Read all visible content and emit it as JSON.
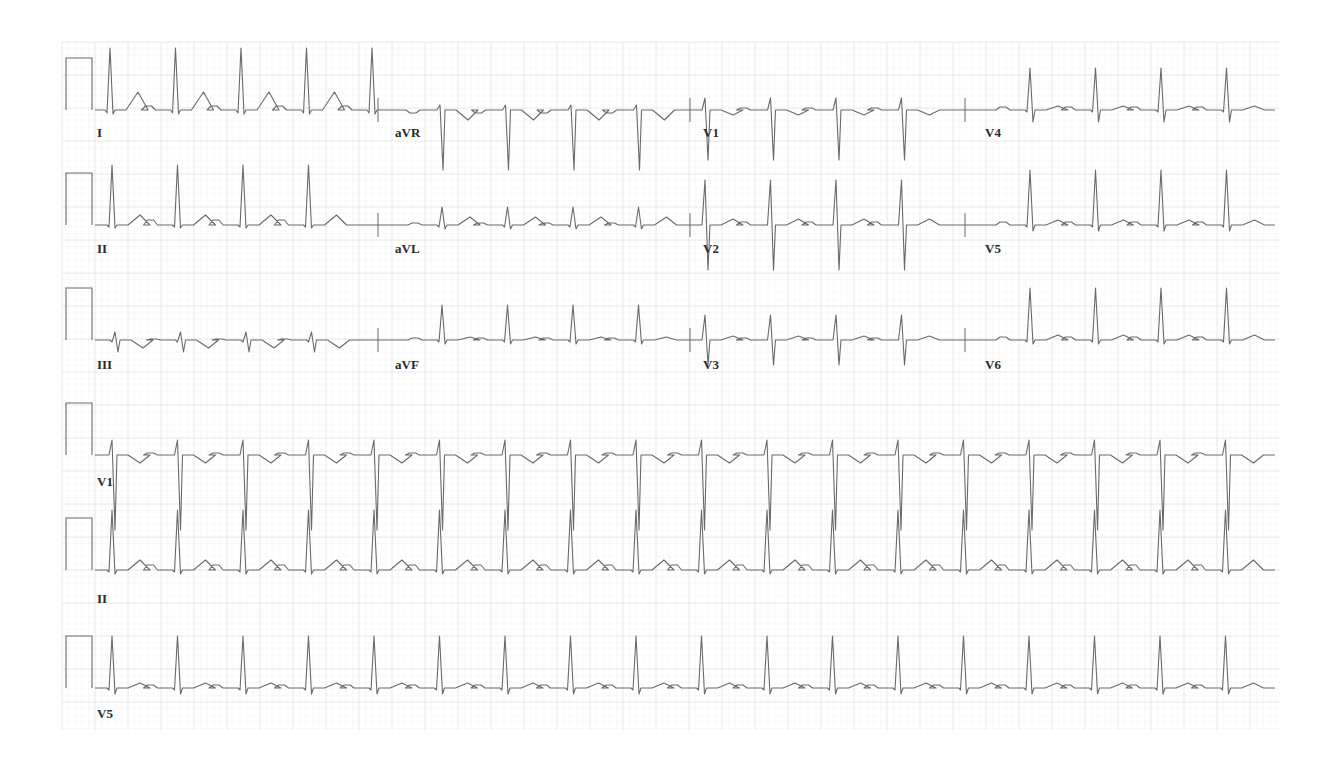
{
  "ecg": {
    "grid": {
      "left": 62,
      "top": 42,
      "right": 1280,
      "bottom": 730,
      "major_px": 33,
      "minor_color": "#f2f2f2",
      "major_color": "#e2e2e2"
    },
    "trace_color": "#6a6a6a",
    "rr_px": 65.5,
    "rows": [
      {
        "baseline": 110,
        "segments": [
          {
            "lead": "I",
            "x0": 95,
            "x1": 378,
            "first_beat": 110,
            "r": 62,
            "s": 4,
            "q": 3,
            "t": 18,
            "p": 4
          },
          {
            "lead": "aVR",
            "x0": 378,
            "x1": 690,
            "first_beat": 440,
            "r": 5,
            "s": 60,
            "q": 0,
            "t": -10,
            "p": -3
          },
          {
            "lead": "V1",
            "x0": 690,
            "x1": 965,
            "first_beat": 705,
            "r": 12,
            "s": 50,
            "q": 0,
            "t": -5,
            "p": 2
          },
          {
            "lead": "V4",
            "x0": 965,
            "x1": 1275,
            "first_beat": 1030,
            "r": 42,
            "s": 12,
            "q": 2,
            "t": 4,
            "p": 3
          }
        ]
      },
      {
        "baseline": 225,
        "segments": [
          {
            "lead": "II",
            "x0": 95,
            "x1": 378,
            "first_beat": 112,
            "r": 60,
            "s": 3,
            "q": 2,
            "t": 10,
            "p": 5
          },
          {
            "lead": "aVL",
            "x0": 378,
            "x1": 690,
            "first_beat": 442,
            "r": 18,
            "s": 4,
            "q": 2,
            "t": 8,
            "p": 2
          },
          {
            "lead": "V2",
            "x0": 690,
            "x1": 965,
            "first_beat": 705,
            "r": 45,
            "s": 45,
            "q": 0,
            "t": 6,
            "p": 3
          },
          {
            "lead": "V5",
            "x0": 965,
            "x1": 1275,
            "first_beat": 1030,
            "r": 55,
            "s": 6,
            "q": 2,
            "t": 5,
            "p": 3
          }
        ]
      },
      {
        "baseline": 340,
        "segments": [
          {
            "lead": "III",
            "x0": 95,
            "x1": 378,
            "first_beat": 115,
            "r": 8,
            "s": 12,
            "q": 2,
            "t": -8,
            "p": 1
          },
          {
            "lead": "aVF",
            "x0": 378,
            "x1": 690,
            "first_beat": 442,
            "r": 35,
            "s": 4,
            "q": 2,
            "t": 3,
            "p": 2
          },
          {
            "lead": "V3",
            "x0": 690,
            "x1": 965,
            "first_beat": 705,
            "r": 25,
            "s": 25,
            "q": 0,
            "t": 4,
            "p": 2
          },
          {
            "lead": "V6",
            "x0": 965,
            "x1": 1275,
            "first_beat": 1030,
            "r": 52,
            "s": 4,
            "q": 2,
            "t": 5,
            "p": 3
          }
        ]
      },
      {
        "baseline": 455,
        "segments": [
          {
            "lead": "V1",
            "x0": 95,
            "x1": 1275,
            "first_beat": 112,
            "r": 15,
            "s": 75,
            "q": 0,
            "t": -8,
            "p": 2
          }
        ]
      },
      {
        "baseline": 570,
        "segments": [
          {
            "lead": "II",
            "x0": 95,
            "x1": 1275,
            "first_beat": 112,
            "r": 60,
            "s": 4,
            "q": 2,
            "t": 10,
            "p": 5
          }
        ]
      },
      {
        "baseline": 688,
        "segments": [
          {
            "lead": "V5",
            "x0": 95,
            "x1": 1275,
            "first_beat": 112,
            "r": 52,
            "s": 6,
            "q": 2,
            "t": 5,
            "p": 3
          }
        ]
      }
    ],
    "labels": [
      {
        "text": "I",
        "x": 97,
        "y": 137
      },
      {
        "text": "aVR",
        "x": 395,
        "y": 137
      },
      {
        "text": "V1",
        "x": 703,
        "y": 137
      },
      {
        "text": "V4",
        "x": 985,
        "y": 137
      },
      {
        "text": "II",
        "x": 97,
        "y": 253
      },
      {
        "text": "aVL",
        "x": 395,
        "y": 253
      },
      {
        "text": "V2",
        "x": 703,
        "y": 253
      },
      {
        "text": "V5",
        "x": 985,
        "y": 253
      },
      {
        "text": "III",
        "x": 97,
        "y": 369
      },
      {
        "text": "aVF",
        "x": 395,
        "y": 369
      },
      {
        "text": "V3",
        "x": 703,
        "y": 369
      },
      {
        "text": "V6",
        "x": 985,
        "y": 369
      },
      {
        "text": "V1",
        "x": 97,
        "y": 486
      },
      {
        "text": "II",
        "x": 97,
        "y": 603
      },
      {
        "text": "V5",
        "x": 97,
        "y": 718
      }
    ]
  }
}
